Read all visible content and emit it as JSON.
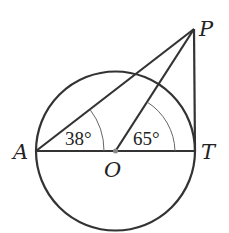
{
  "diagram": {
    "points": {
      "A": {
        "label": "A",
        "x": 36,
        "y": 151
      },
      "O": {
        "label": "O",
        "x": 115,
        "y": 151
      },
      "T": {
        "label": "T",
        "x": 195,
        "y": 151
      },
      "P": {
        "label": "P",
        "x": 194,
        "y": 29
      }
    },
    "circle": {
      "center": "O",
      "radius": 79
    },
    "angles": {
      "PAO": {
        "label": "38°"
      },
      "POT": {
        "label": "65°"
      }
    },
    "colors": {
      "stroke": "#333333",
      "arc": "#666666",
      "center_dot": "#888888"
    }
  }
}
